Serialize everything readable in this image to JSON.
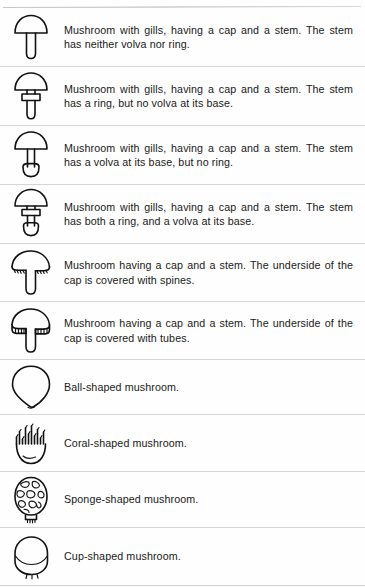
{
  "document": {
    "kind": "mushroom-morphology-legend",
    "row_count": 10
  },
  "rows": [
    {
      "icon": "mushroom-gilled-plain-icon",
      "icon_label": "Gilled mushroom with plain stem",
      "description": "Mushroom with gills, having a cap and a stem. The stem has neither volva nor ring."
    },
    {
      "icon": "mushroom-gilled-ring-icon",
      "icon_label": "Gilled mushroom with ring on stem",
      "description": "Mushroom with gills, having a cap and a stem. The stem has a ring, but no volva at its base."
    },
    {
      "icon": "mushroom-gilled-volva-icon",
      "icon_label": "Gilled mushroom with volva at base",
      "description": "Mushroom with gills, having a cap and a stem. The stem has a volva at its base, but no ring."
    },
    {
      "icon": "mushroom-gilled-ring-volva-icon",
      "icon_label": "Gilled mushroom with ring and volva",
      "description": "Mushroom with gills, having a cap and a stem. The stem has both a ring, and a volva at its base."
    },
    {
      "icon": "mushroom-spined-icon",
      "icon_label": "Mushroom with spines under cap",
      "description": "Mushroom having a cap and a stem. The underside of the cap is covered with spines."
    },
    {
      "icon": "mushroom-tubed-icon",
      "icon_label": "Mushroom with tubes under cap",
      "description": "Mushroom having a cap and a stem. The underside of the cap is covered with tubes."
    },
    {
      "icon": "mushroom-ball-icon",
      "icon_label": "Ball-shaped mushroom",
      "description": "Ball-shaped mushroom."
    },
    {
      "icon": "mushroom-coral-icon",
      "icon_label": "Coral-shaped mushroom",
      "description": "Coral-shaped mushroom."
    },
    {
      "icon": "mushroom-sponge-icon",
      "icon_label": "Sponge-shaped mushroom",
      "description": "Sponge-shaped mushroom."
    },
    {
      "icon": "mushroom-cup-icon",
      "icon_label": "Cup-shaped mushroom",
      "description": "Cup-shaped mushroom."
    }
  ],
  "colors": {
    "ink": "#111111",
    "text": "#191919",
    "divider": "#d5d5d5",
    "background": "#fefefe"
  }
}
